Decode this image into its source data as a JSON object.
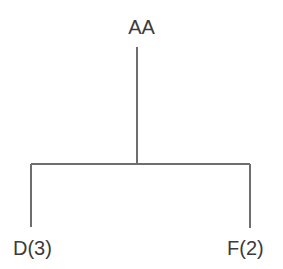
{
  "diagram": {
    "type": "tree",
    "title": "",
    "background_color": "#ffffff",
    "line_color": "#6e6e6e",
    "text_color": "#3b3b3b",
    "root": {
      "label": "AA",
      "x": 137,
      "y": 28
    },
    "leaves": [
      {
        "label": "D(3)",
        "name": "D",
        "count": 3,
        "x": 31,
        "y": 248
      },
      {
        "label": "F(2)",
        "name": "F",
        "count": 2,
        "x": 250,
        "y": 248
      }
    ],
    "edges": {
      "stem": {
        "x": 137,
        "y_top": 47,
        "y_bottom": 164
      },
      "crossbar": {
        "y": 164,
        "x_left": 31,
        "x_right": 250
      },
      "drop_left": {
        "x": 31,
        "y_top": 164,
        "y_bottom": 227
      },
      "drop_right": {
        "x": 250,
        "y_top": 164,
        "y_bottom": 228
      }
    }
  }
}
